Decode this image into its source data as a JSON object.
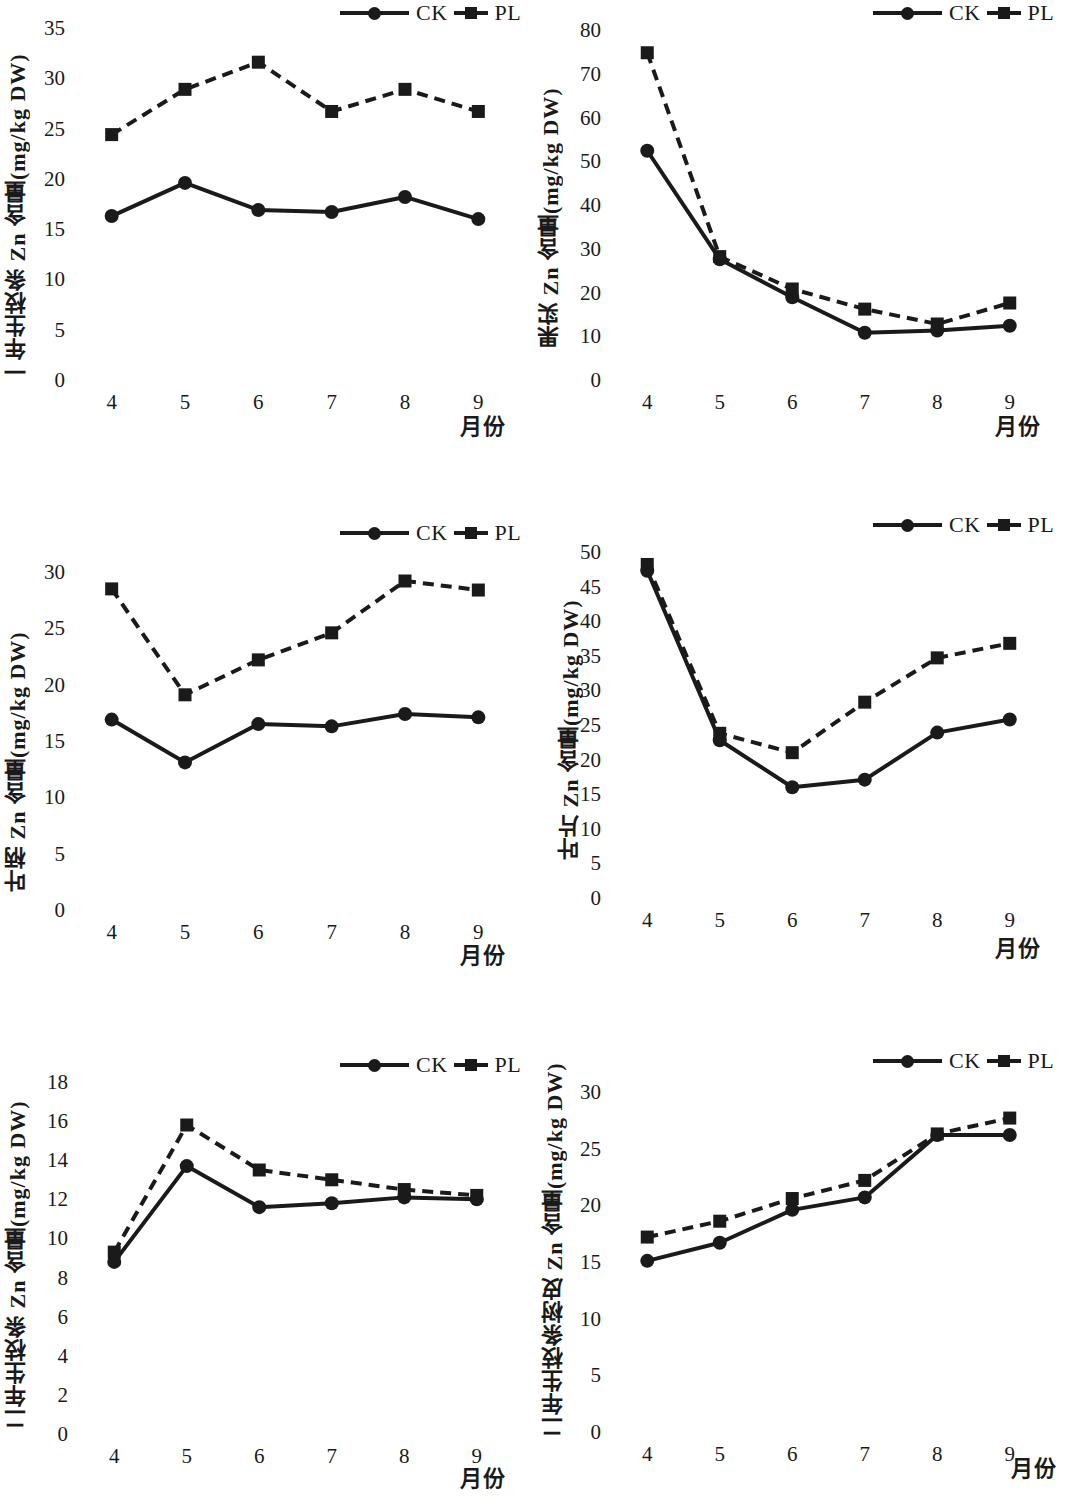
{
  "legend": {
    "ck_label": "CK",
    "pl_label": "PL",
    "ck_icon": "circle-marker-solid-line",
    "pl_icon": "square-marker-dashed-line"
  },
  "axis": {
    "x_title": "月份",
    "categories": [
      "4",
      "5",
      "6",
      "7",
      "8",
      "9"
    ]
  },
  "color": {
    "ink": "#1a1a1a",
    "background": "#ffffff"
  },
  "chart_data": [
    {
      "id": "one-year-shoot",
      "type": "line",
      "title": "",
      "xlabel": "月份",
      "ylabel": "一年生枝条 Zn 含量(mg/kg DW)",
      "categories": [
        "4",
        "5",
        "6",
        "7",
        "8",
        "9"
      ],
      "ylim": [
        0,
        35
      ],
      "yticks": [
        0,
        5,
        10,
        15,
        20,
        25,
        30,
        35
      ],
      "grid": false,
      "legend_position": "top-right",
      "series": [
        {
          "name": "CK",
          "style": "solid-circle",
          "values": [
            16.3,
            19.6,
            16.9,
            16.7,
            18.2,
            16.0
          ]
        },
        {
          "name": "PL",
          "style": "dashed-square",
          "values": [
            24.4,
            28.9,
            31.6,
            26.7,
            28.9,
            26.7
          ]
        }
      ]
    },
    {
      "id": "fruit",
      "type": "line",
      "title": "",
      "xlabel": "月份",
      "ylabel": "果实 Zn 含量(mg/kg DW)",
      "categories": [
        "4",
        "5",
        "6",
        "7",
        "8",
        "9"
      ],
      "ylim": [
        0,
        80
      ],
      "yticks": [
        0,
        10,
        20,
        30,
        40,
        50,
        60,
        70,
        80
      ],
      "grid": false,
      "legend_position": "top-right",
      "series": [
        {
          "name": "CK",
          "style": "solid-circle",
          "values": [
            52.4,
            27.6,
            18.9,
            10.8,
            11.3,
            12.4
          ]
        },
        {
          "name": "PL",
          "style": "dashed-square",
          "values": [
            74.8,
            28.2,
            20.8,
            16.2,
            12.8,
            17.6
          ]
        }
      ]
    },
    {
      "id": "petiole",
      "type": "line",
      "title": "",
      "xlabel": "月份",
      "ylabel": "叶柄 Zn 含量(mg/kg DW)",
      "categories": [
        "4",
        "5",
        "6",
        "7",
        "8",
        "9"
      ],
      "ylim": [
        0,
        30
      ],
      "yticks": [
        0,
        5,
        10,
        15,
        20,
        25,
        30
      ],
      "grid": false,
      "legend_position": "top-right",
      "series": [
        {
          "name": "CK",
          "style": "solid-circle",
          "values": [
            16.9,
            13.1,
            16.5,
            16.3,
            17.4,
            17.1
          ]
        },
        {
          "name": "PL",
          "style": "dashed-square",
          "values": [
            28.5,
            19.1,
            22.2,
            24.6,
            29.2,
            28.4
          ]
        }
      ]
    },
    {
      "id": "leaf",
      "type": "line",
      "title": "",
      "xlabel": "月份",
      "ylabel": "叶片 Zn 含量(mg/kg DW)",
      "categories": [
        "4",
        "5",
        "6",
        "7",
        "8",
        "9"
      ],
      "ylim": [
        0,
        50
      ],
      "yticks": [
        0,
        5,
        10,
        15,
        20,
        25,
        30,
        35,
        40,
        45,
        50
      ],
      "grid": false,
      "legend_position": "top-right",
      "series": [
        {
          "name": "CK",
          "style": "solid-circle",
          "values": [
            47.3,
            22.8,
            16.0,
            17.1,
            23.9,
            25.8
          ]
        },
        {
          "name": "PL",
          "style": "dashed-square",
          "values": [
            48.2,
            23.8,
            21.0,
            28.3,
            34.7,
            36.8
          ]
        }
      ]
    },
    {
      "id": "two-year-shoot",
      "type": "line",
      "title": "",
      "xlabel": "月份",
      "ylabel": "二年生枝条 Zn 含量(mg/kg DW)",
      "categories": [
        "4",
        "5",
        "6",
        "7",
        "8",
        "9"
      ],
      "ylim": [
        0,
        18
      ],
      "yticks": [
        0,
        2,
        4,
        6,
        8,
        10,
        12,
        14,
        16,
        18
      ],
      "grid": false,
      "legend_position": "top-right",
      "series": [
        {
          "name": "CK",
          "style": "solid-circle",
          "values": [
            8.8,
            13.7,
            11.6,
            11.8,
            12.1,
            12.0
          ]
        },
        {
          "name": "PL",
          "style": "dashed-square",
          "values": [
            9.3,
            15.8,
            13.5,
            13.0,
            12.5,
            12.2
          ]
        }
      ]
    },
    {
      "id": "two-year-shoot-bark",
      "type": "line",
      "title": "",
      "xlabel": "月份",
      "ylabel": "二年生枝条树皮 Zn 含量(mg/kg DW)",
      "categories": [
        "4",
        "5",
        "6",
        "7",
        "8",
        "9"
      ],
      "ylim": [
        0,
        30
      ],
      "yticks": [
        0,
        5,
        10,
        15,
        20,
        25,
        30
      ],
      "grid": false,
      "legend_position": "top-right",
      "series": [
        {
          "name": "CK",
          "style": "solid-circle",
          "values": [
            15.1,
            16.7,
            19.6,
            20.7,
            26.2,
            26.2
          ]
        },
        {
          "name": "PL",
          "style": "dashed-square",
          "values": [
            17.2,
            18.6,
            20.6,
            22.2,
            26.3,
            27.7
          ]
        }
      ]
    }
  ]
}
